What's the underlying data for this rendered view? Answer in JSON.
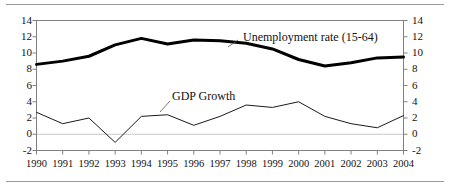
{
  "figure": {
    "has_top_rule": true,
    "has_bottom_rule": true,
    "frame_color": "#808080",
    "text_color": "#111111"
  },
  "chart_data": {
    "type": "line",
    "title": "",
    "xlabel": "",
    "ylabel": "",
    "categories": [
      "1990",
      "1991",
      "1992",
      "1993",
      "1994",
      "1995",
      "1996",
      "1997",
      "1998",
      "1999",
      "2000",
      "2001",
      "2002",
      "2003",
      "2004"
    ],
    "x": [
      1990,
      1991,
      1992,
      1993,
      1994,
      1995,
      1996,
      1997,
      1998,
      1999,
      2000,
      2001,
      2002,
      2003,
      2004
    ],
    "ylim": [
      -2,
      14
    ],
    "yticks": [
      -2,
      0,
      2,
      4,
      6,
      8,
      10,
      12,
      14
    ],
    "ytick_labels": [
      "-2",
      "0",
      "2",
      "4",
      "6",
      "8",
      "10",
      "12",
      "14"
    ],
    "right_axis": true,
    "right_yticks": [
      -2,
      0,
      2,
      4,
      6,
      8,
      10,
      12,
      14
    ],
    "right_ytick_labels": [
      "-2",
      "0",
      "2",
      "4",
      "6",
      "8",
      "10",
      "12",
      "14"
    ],
    "grid": false,
    "zero_line": true,
    "zero_line_color": "#c8c8c8",
    "legend": "inline-annotations",
    "series": [
      {
        "name": "Unemployment rate (15-64)",
        "color": "#000000",
        "width": 3.0,
        "values": [
          8.6,
          9.0,
          9.6,
          11.0,
          11.8,
          11.1,
          11.6,
          11.5,
          11.2,
          10.5,
          9.2,
          8.4,
          8.8,
          9.4,
          9.5
        ]
      },
      {
        "name": "GDP Growth",
        "color": "#1a1a1a",
        "width": 1.0,
        "values": [
          2.7,
          1.3,
          2.0,
          -1.0,
          2.2,
          2.4,
          1.1,
          2.2,
          3.6,
          3.3,
          4.0,
          2.2,
          1.3,
          0.8,
          2.3
        ]
      }
    ],
    "annotations": [
      {
        "text": "Unemployment rate (15-64)",
        "label_x": 243,
        "label_y": 31,
        "leader_from_x": 238,
        "leader_from_y": 40,
        "leader_to_x": 228,
        "leader_to_y": 47
      },
      {
        "text": "GDP Growth",
        "label_x": 172,
        "label_y": 90,
        "leader_from_x": 170,
        "leader_from_y": 101,
        "leader_to_x": 160,
        "leader_to_y": 112
      }
    ]
  }
}
